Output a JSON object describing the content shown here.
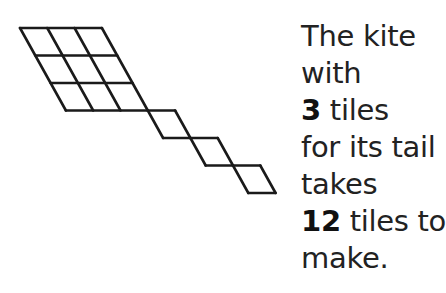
{
  "diagram": {
    "body_rows": 3,
    "body_cols": 3,
    "tail_tiles": 3,
    "total_tiles": 12,
    "stroke_color": "#1a1a1a",
    "background": "#ffffff"
  },
  "caption": {
    "lines": [
      {
        "text": "The kite"
      },
      {
        "text": "with"
      },
      {
        "bold": "3",
        "text": " tiles"
      },
      {
        "text": "for its tail"
      },
      {
        "text": "takes"
      },
      {
        "bold": "12",
        "text": " tiles to"
      },
      {
        "text": "make."
      }
    ]
  }
}
